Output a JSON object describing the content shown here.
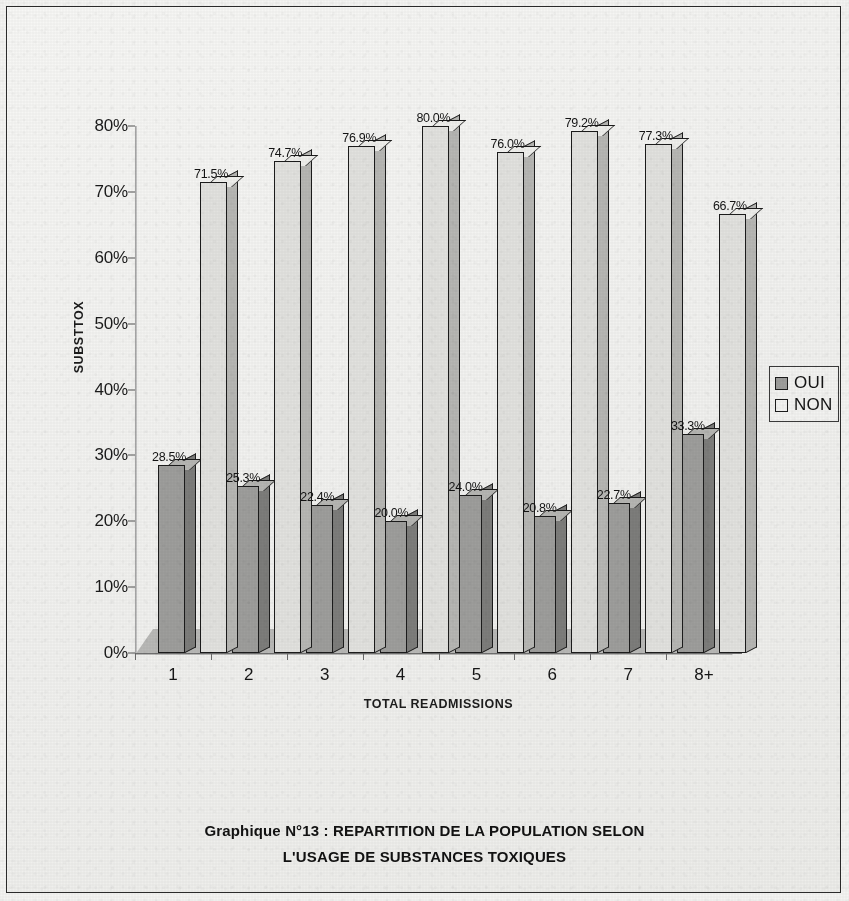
{
  "chart_data": {
    "type": "bar",
    "title": "Graphique N°13 : REPARTITION DE LA POPULATION SELON L'USAGE DE SUBSTANCES TOXIQUES",
    "title_line1": "Graphique N°13 : REPARTITION DE LA POPULATION SELON",
    "title_line2": "L'USAGE DE SUBSTANCES TOXIQUES",
    "xlabel": "TOTAL READMISSIONS",
    "ylabel": "SUBSTTOX",
    "categories": [
      "1",
      "2",
      "3",
      "4",
      "5",
      "6",
      "7",
      "8+"
    ],
    "ylim": [
      0,
      80
    ],
    "ytick_labels": [
      "80%",
      "70%",
      "60%",
      "50%",
      "40%",
      "30%",
      "20%",
      "10%",
      "0%"
    ],
    "ytick_values": [
      80,
      70,
      60,
      50,
      40,
      30,
      20,
      10,
      0
    ],
    "grid": false,
    "legend_position": "right",
    "style": "3d-column",
    "series": [
      {
        "name": "OUI",
        "color": "#9e9e9c",
        "values": [
          28.5,
          25.3,
          22.4,
          20.0,
          24.0,
          20.8,
          22.7,
          33.3
        ],
        "labels": [
          "28.5%",
          "25.3%",
          "22.4%",
          "20.0%",
          "24.0%",
          "20.8%",
          "22.7%",
          "33.3%"
        ]
      },
      {
        "name": "NON",
        "color": "#e2e2df",
        "values": [
          71.5,
          74.7,
          76.9,
          80.0,
          76.0,
          79.2,
          77.3,
          66.7
        ],
        "labels": [
          "71.5%",
          "74.7%",
          "76.9%",
          "80.0%",
          "76.0%",
          "79.2%",
          "77.3%",
          "66.7%"
        ]
      }
    ]
  },
  "legend": {
    "entries": [
      {
        "label": "OUI",
        "swatch": "oui-sw"
      },
      {
        "label": "NON",
        "swatch": "non-sw"
      }
    ]
  }
}
